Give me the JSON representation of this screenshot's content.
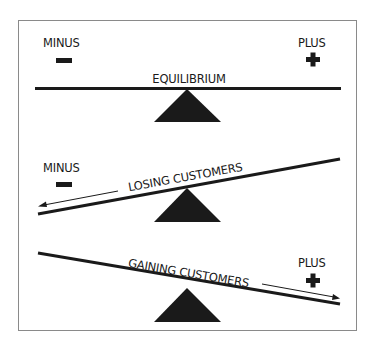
{
  "colors": {
    "background": "#ffffff",
    "ink": "#1a1a1a",
    "frame": "#8a8a8a"
  },
  "panels": [
    {
      "id": "equilibrium",
      "beam_label": "EQUILIBRIUM",
      "left_label": "MINUS",
      "left_icon": "minus-icon",
      "right_label": "PLUS",
      "right_icon": "plus-icon"
    },
    {
      "id": "losing",
      "beam_label": "LOSING CUSTOMERS",
      "left_label": "MINUS",
      "left_icon": "minus-icon",
      "arrow_direction": "left"
    },
    {
      "id": "gaining",
      "beam_label": "GAINING CUSTOMERS",
      "right_label": "PLUS",
      "right_icon": "plus-icon",
      "arrow_direction": "right"
    }
  ]
}
